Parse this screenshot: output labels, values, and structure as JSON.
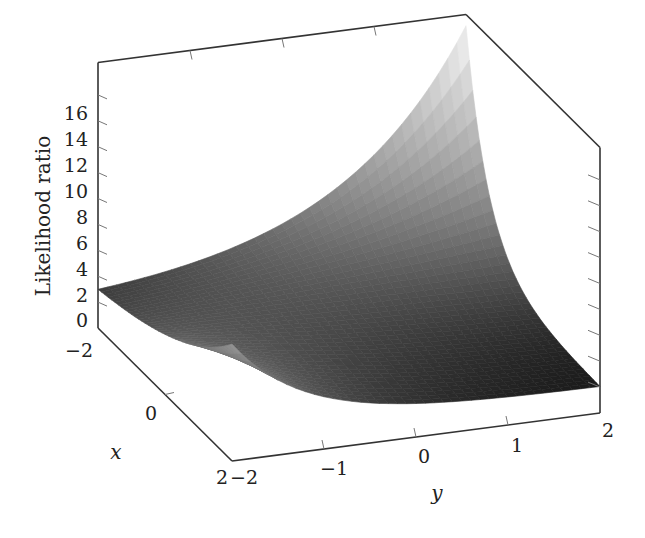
{
  "chart_data": {
    "type": "surface3d",
    "title": "",
    "xlabel": "x",
    "ylabel": "y",
    "zlabel": "Likelihood ratio",
    "xlim": [
      -2,
      2
    ],
    "ylim": [
      -2,
      2
    ],
    "zlim": [
      -2,
      18
    ],
    "x_ticks": [
      "-2",
      "0",
      "2"
    ],
    "y_ticks": [
      "-2",
      "-1",
      "0",
      "1",
      "2"
    ],
    "z_ticks": [
      "-2",
      "0",
      "2",
      "4",
      "6",
      "8",
      "10",
      "12",
      "14",
      "16"
    ],
    "colormap": "grayscale (dark = low, light = high)",
    "surface_model": "z = exp(0.45 - 0.49 x - 0.26 y - 0.49 x y)",
    "surface_corners": [
      {
        "x": -2,
        "y": -2,
        "z": 1.0
      },
      {
        "x": -2,
        "y": 2,
        "z": 17.5
      },
      {
        "x": 2,
        "y": -2,
        "z": 7.0
      },
      {
        "x": 2,
        "y": 2,
        "z": 0.05
      }
    ],
    "grid": {
      "x": [
        -2,
        -1.5,
        -1,
        -0.5,
        0,
        0.5,
        1,
        1.5,
        2
      ],
      "y": [
        -2,
        -1.5,
        -1,
        -0.5,
        0,
        0.5,
        1,
        1.5,
        2
      ]
    },
    "grid_on": false,
    "legend": null
  },
  "labels": {
    "z_axis": "Likelihood ratio",
    "x_axis": "x",
    "y_axis": "y",
    "z_tick_labels": [
      "16",
      "14",
      "12",
      "10",
      "8",
      "6",
      "4",
      "2",
      "0",
      "−2"
    ],
    "x_tick_labels": [
      "−2",
      "0",
      "2"
    ],
    "y_tick_labels": [
      "−2",
      "−1",
      "0",
      "1",
      "2"
    ]
  }
}
